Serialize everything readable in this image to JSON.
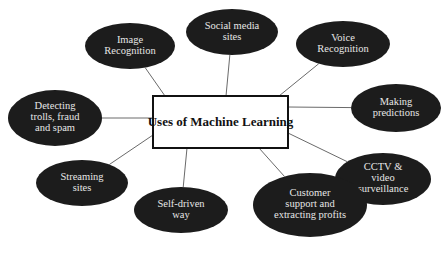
{
  "diagram": {
    "type": "mind-map",
    "center": {
      "label": "Uses of Machine Learning",
      "x": 153,
      "y": 96,
      "w": 135,
      "h": 52
    },
    "colors": {
      "bubble_fill": "#1c1c1c",
      "bubble_text": "#e6e6e6",
      "center_border": "#111111",
      "connector": "#6a6a6a",
      "background": "#ffffff"
    },
    "nodes": [
      {
        "id": "image-recognition",
        "lines": [
          "Image",
          "Recognition"
        ],
        "cx": 130,
        "cy": 46,
        "rx": 45,
        "ry": 23,
        "anchor": [
          165,
          96
        ]
      },
      {
        "id": "social-media-sites",
        "lines": [
          "Social media",
          "sites"
        ],
        "cx": 232,
        "cy": 32,
        "rx": 46,
        "ry": 23,
        "anchor": [
          226,
          96
        ]
      },
      {
        "id": "voice-recognition",
        "lines": [
          "Voice",
          "Recognition"
        ],
        "cx": 343,
        "cy": 44,
        "rx": 47,
        "ry": 23,
        "anchor": [
          279,
          96
        ]
      },
      {
        "id": "making-predictions",
        "lines": [
          "Making",
          "predictions"
        ],
        "cx": 396,
        "cy": 108,
        "rx": 45,
        "ry": 24,
        "anchor": [
          288,
          107
        ]
      },
      {
        "id": "cctv-video-surveillance",
        "lines": [
          "CCTV &",
          "video",
          "surveillance"
        ],
        "cx": 383,
        "cy": 179,
        "rx": 48,
        "ry": 26,
        "anchor": [
          288,
          133
        ]
      },
      {
        "id": "customer-support",
        "lines": [
          "Customer",
          "support and",
          "extracting profits"
        ],
        "cx": 310,
        "cy": 205,
        "rx": 57,
        "ry": 32,
        "anchor": [
          259,
          148
        ]
      },
      {
        "id": "self-driven-way",
        "lines": [
          "Self-driven",
          "way"
        ],
        "cx": 181,
        "cy": 210,
        "rx": 47,
        "ry": 23,
        "anchor": [
          187,
          148
        ]
      },
      {
        "id": "streaming-sites",
        "lines": [
          "Streaming",
          "sites"
        ],
        "cx": 82,
        "cy": 183,
        "rx": 46,
        "ry": 23,
        "anchor": [
          153,
          135
        ]
      },
      {
        "id": "detecting-trolls",
        "lines": [
          "Detecting",
          "trolls, fraud",
          "and spam"
        ],
        "cx": 55,
        "cy": 118,
        "rx": 47,
        "ry": 28,
        "anchor": [
          153,
          118
        ]
      }
    ]
  }
}
